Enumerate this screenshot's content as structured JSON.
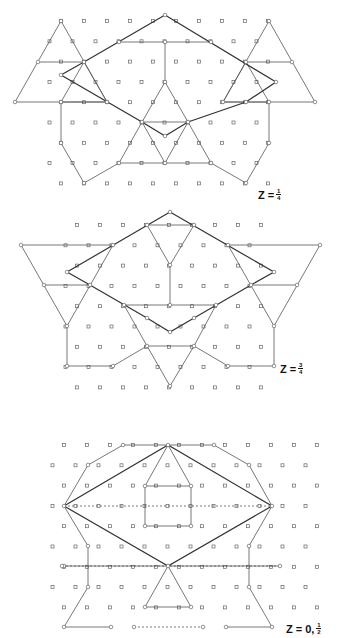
{
  "colors": {
    "line": "#555555",
    "bold_line": "#333333",
    "node": "#666666",
    "background": "#ffffff"
  },
  "panels": [
    {
      "id": "z-quarter",
      "label": {
        "prefix": "Z =",
        "num": "1",
        "den": "4",
        "x": 258,
        "y": 188
      },
      "lattice": {
        "x0": 61,
        "y0": 21,
        "dx": 23,
        "dy": 20.3,
        "rows": 9,
        "cols": 10
      },
      "bold_polys": [
        [
          [
            165,
            15
          ],
          [
            276,
            82
          ],
          [
            246,
            102
          ],
          [
            188,
            122
          ],
          [
            165,
            136
          ],
          [
            142,
            122
          ],
          [
            61,
            75
          ],
          [
            84,
            62
          ],
          [
            165,
            15
          ]
        ]
      ],
      "thin_polys": [
        [
          [
            61,
            21
          ],
          [
            15,
            102
          ],
          [
            107,
            102
          ],
          [
            61,
            21
          ]
        ],
        [
          [
            269,
            21
          ],
          [
            223,
            102
          ],
          [
            315,
            102
          ],
          [
            269,
            21
          ]
        ],
        [
          [
            38,
            62
          ],
          [
            84,
            62
          ]
        ],
        [
          [
            246,
            62
          ],
          [
            292,
            62
          ]
        ],
        [
          [
            119,
            42
          ],
          [
            211,
            42
          ]
        ],
        [
          [
            165,
            42
          ],
          [
            165,
            82
          ]
        ],
        [
          [
            165,
            82
          ],
          [
            142,
            122
          ],
          [
            119,
            163
          ],
          [
            211,
            163
          ],
          [
            188,
            122
          ],
          [
            165,
            82
          ]
        ],
        [
          [
            142,
            122
          ],
          [
            188,
            122
          ]
        ],
        [
          [
            61,
            102
          ],
          [
            61,
            143
          ],
          [
            84,
            183
          ],
          [
            119,
            163
          ]
        ],
        [
          [
            269,
            102
          ],
          [
            269,
            143
          ],
          [
            246,
            183
          ],
          [
            211,
            163
          ]
        ],
        [
          [
            61,
            102
          ],
          [
            107,
            102
          ]
        ],
        [
          [
            223,
            102
          ],
          [
            269,
            102
          ]
        ],
        [
          [
            84,
            62
          ],
          [
            107,
            102
          ]
        ],
        [
          [
            246,
            62
          ],
          [
            223,
            102
          ]
        ],
        [
          [
            61,
            102
          ],
          [
            84,
            62
          ]
        ],
        [
          [
            269,
            102
          ],
          [
            246,
            62
          ]
        ],
        [
          [
            142,
            122
          ],
          [
            165,
            163
          ]
        ],
        [
          [
            188,
            122
          ],
          [
            165,
            163
          ]
        ]
      ]
    },
    {
      "id": "z-three-quarter",
      "label": {
        "prefix": "Z =",
        "num": "3",
        "den": "4",
        "x": 280,
        "y": 362
      },
      "lattice": {
        "x0": 77,
        "y0": 225,
        "dx": 23,
        "dy": 20.3,
        "rows": 9,
        "cols": 9
      },
      "bold_polys": [
        [
          [
            170,
            212
          ],
          [
            274,
            272
          ],
          [
            251,
            285
          ],
          [
            194,
            318
          ],
          [
            170,
            332
          ],
          [
            147,
            318
          ],
          [
            90,
            285
          ],
          [
            67,
            272
          ],
          [
            170,
            212
          ]
        ]
      ],
      "thin_polys": [
        [
          [
            21,
            245
          ],
          [
            113,
            245
          ]
        ],
        [
          [
            228,
            245
          ],
          [
            320,
            245
          ]
        ],
        [
          [
            21,
            245
          ],
          [
            67,
            326
          ]
        ],
        [
          [
            113,
            245
          ],
          [
            67,
            326
          ]
        ],
        [
          [
            320,
            245
          ],
          [
            274,
            326
          ]
        ],
        [
          [
            228,
            245
          ],
          [
            274,
            326
          ]
        ],
        [
          [
            44,
            285
          ],
          [
            90,
            285
          ]
        ],
        [
          [
            251,
            285
          ],
          [
            297,
            285
          ]
        ],
        [
          [
            147,
            225
          ],
          [
            194,
            225
          ]
        ],
        [
          [
            147,
            225
          ],
          [
            170,
            265
          ]
        ],
        [
          [
            194,
            225
          ],
          [
            170,
            265
          ]
        ],
        [
          [
            170,
            265
          ],
          [
            170,
            305
          ]
        ],
        [
          [
            124,
            305
          ],
          [
            216,
            305
          ]
        ],
        [
          [
            124,
            305
          ],
          [
            147,
            346
          ]
        ],
        [
          [
            216,
            305
          ],
          [
            194,
            346
          ]
        ],
        [
          [
            147,
            346
          ],
          [
            194,
            346
          ]
        ],
        [
          [
            147,
            346
          ],
          [
            170,
            386
          ]
        ],
        [
          [
            194,
            346
          ],
          [
            170,
            386
          ]
        ],
        [
          [
            67,
            326
          ],
          [
            67,
            366
          ],
          [
            113,
            366
          ],
          [
            147,
            346
          ]
        ],
        [
          [
            274,
            326
          ],
          [
            274,
            366
          ],
          [
            228,
            366
          ],
          [
            194,
            346
          ]
        ]
      ]
    },
    {
      "id": "z-zero-half",
      "label": {
        "prefix": "Z = 0,",
        "num": "1",
        "den": "2",
        "x": 286,
        "y": 622
      },
      "lattice": {
        "x0": 64,
        "y0": 445,
        "dx": 23,
        "dy": 20.3,
        "rows": 9,
        "cols": 12
      },
      "bold_polys": [
        [
          [
            64,
            506
          ],
          [
            168,
            445
          ],
          [
            272,
            506
          ],
          [
            168,
            566
          ],
          [
            64,
            506
          ]
        ]
      ],
      "thin_polys": [
        [
          [
            64,
            506
          ],
          [
            88,
            465
          ],
          [
            123,
            445
          ],
          [
            214,
            445
          ],
          [
            249,
            465
          ],
          [
            272,
            506
          ],
          [
            249,
            546
          ],
          [
            249,
            587
          ],
          [
            272,
            627
          ]
        ],
        [
          [
            64,
            506
          ],
          [
            88,
            546
          ],
          [
            88,
            587
          ],
          [
            64,
            627
          ],
          [
            111,
            627
          ]
        ],
        [
          [
            272,
            627
          ],
          [
            226,
            627
          ]
        ],
        [
          [
            145,
            486
          ],
          [
            191,
            486
          ],
          [
            191,
            526
          ],
          [
            145,
            526
          ],
          [
            145,
            486
          ]
        ],
        [
          [
            145,
            607
          ],
          [
            191,
            607
          ]
        ],
        [
          [
            168,
            445
          ],
          [
            145,
            486
          ]
        ],
        [
          [
            168,
            445
          ],
          [
            191,
            486
          ]
        ],
        [
          [
            168,
            566
          ],
          [
            145,
            607
          ]
        ],
        [
          [
            168,
            566
          ],
          [
            191,
            607
          ]
        ],
        [
          [
            64,
            566
          ],
          [
            280,
            566
          ]
        ]
      ],
      "dashed_polys": [
        [
          [
            64,
            506
          ],
          [
            272,
            506
          ]
        ],
        [
          [
            134,
            627
          ],
          [
            203,
            627
          ]
        ],
        [
          [
            62,
            566
          ],
          [
            280,
            566
          ]
        ]
      ]
    }
  ]
}
